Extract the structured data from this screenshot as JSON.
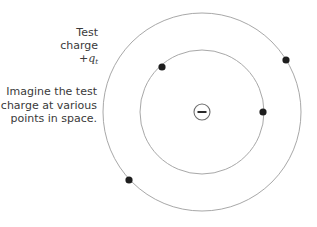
{
  "labels": {
    "test_charge": {
      "line1": "Test",
      "line2": "charge",
      "symbol_prefix": "+",
      "symbol": "q",
      "symbol_subscript": "t"
    },
    "imagine": {
      "line1": "Imagine the test",
      "line2": "charge at various",
      "line3": "points in space."
    }
  },
  "diagram": {
    "center_charge": {
      "sign": "−",
      "icon": "negative-charge-icon",
      "cx": 202,
      "cy": 112,
      "r": 8
    },
    "circles": [
      {
        "name": "outer",
        "cx": 202,
        "cy": 112,
        "r": 99
      },
      {
        "name": "inner",
        "cx": 202,
        "cy": 112,
        "r": 62
      }
    ],
    "test_charge_positions": [
      {
        "cx": 162,
        "cy": 67
      },
      {
        "cx": 286,
        "cy": 60
      },
      {
        "cx": 263,
        "cy": 112
      },
      {
        "cx": 129,
        "cy": 180
      }
    ],
    "colors": {
      "circle_stroke": "#a8a8a8",
      "dot_fill": "#1e1e1e",
      "text": "#3a3a3a",
      "center_stroke": "#6e6e6e"
    }
  }
}
